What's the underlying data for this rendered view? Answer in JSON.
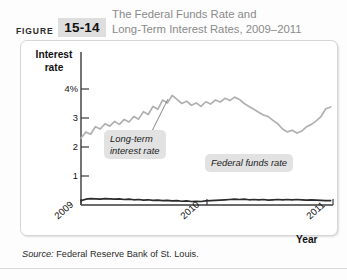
{
  "figure": {
    "label": "FIGURE",
    "number": "15-14"
  },
  "title": {
    "line1": "The Federal Funds Rate and",
    "line2": "Long-Term Interest Rates, 2009–2011"
  },
  "source": {
    "prefix": "Source:",
    "text": "Federal Reserve Bank of St. Louis."
  },
  "colors": {
    "longterm_line": "#b0b0b0",
    "federal_funds_line": "#2b2b2b",
    "axis": "#3a3a3a",
    "callout_bg": "#e2e2e2",
    "title_text": "#8a8a8a",
    "figure_box_bg": "#dedede"
  },
  "chart_data": {
    "type": "line",
    "title": "The Federal Funds Rate and Long-Term Interest Rates, 2009–2011",
    "xlabel": "Year",
    "ylabel": "Interest rate",
    "ylim": [
      0,
      4.4
    ],
    "xlim": [
      2009.0,
      2011.1
    ],
    "grid": false,
    "legend": "annotations",
    "yticks": [
      {
        "value": 4,
        "label": "4%"
      },
      {
        "value": 3,
        "label": "3"
      },
      {
        "value": 2,
        "label": "2"
      },
      {
        "value": 1,
        "label": "1"
      }
    ],
    "xticks": [
      {
        "value": 2009,
        "label": "2009"
      },
      {
        "value": 2010,
        "label": "2010"
      },
      {
        "value": 2011,
        "label": "2011"
      }
    ],
    "annotations": [
      {
        "name": "long-term-interest-rate",
        "line1": "Long-term",
        "line2": "interest rate",
        "text": "Long-term interest rate"
      },
      {
        "name": "federal-funds-rate",
        "text": "Federal funds rate"
      }
    ],
    "series": [
      {
        "name": "Long-term interest rate",
        "color": "#b0b0b0",
        "x": [
          2009.0,
          2009.04,
          2009.08,
          2009.12,
          2009.16,
          2009.2,
          2009.24,
          2009.28,
          2009.32,
          2009.36,
          2009.4,
          2009.44,
          2009.48,
          2009.52,
          2009.56,
          2009.6,
          2009.64,
          2009.68,
          2009.72,
          2009.76,
          2009.8,
          2009.84,
          2009.88,
          2009.92,
          2009.96,
          2010.0,
          2010.04,
          2010.08,
          2010.12,
          2010.16,
          2010.2,
          2010.24,
          2010.28,
          2010.32,
          2010.36,
          2010.4,
          2010.44,
          2010.48,
          2010.52,
          2010.56,
          2010.6,
          2010.64,
          2010.68,
          2010.72,
          2010.76,
          2010.8,
          2010.84,
          2010.88,
          2010.92,
          2010.96,
          2011.0,
          2011.04,
          2011.08
        ],
        "values": [
          2.3,
          2.52,
          2.44,
          2.7,
          2.62,
          2.8,
          2.72,
          2.88,
          2.78,
          2.95,
          2.86,
          3.05,
          2.96,
          3.22,
          3.12,
          3.4,
          3.3,
          3.62,
          3.52,
          3.78,
          3.64,
          3.5,
          3.58,
          3.44,
          3.52,
          3.4,
          3.56,
          3.48,
          3.62,
          3.55,
          3.68,
          3.6,
          3.72,
          3.64,
          3.5,
          3.4,
          3.3,
          3.2,
          3.1,
          3.05,
          2.92,
          2.8,
          2.62,
          2.52,
          2.58,
          2.48,
          2.55,
          2.7,
          2.78,
          2.9,
          3.05,
          3.32,
          3.38
        ]
      },
      {
        "name": "Federal funds rate",
        "color": "#2b2b2b",
        "x": [
          2009.0,
          2009.04,
          2009.08,
          2009.12,
          2009.16,
          2009.2,
          2009.24,
          2009.28,
          2009.32,
          2009.36,
          2009.4,
          2009.44,
          2009.48,
          2009.52,
          2009.56,
          2009.6,
          2009.64,
          2009.68,
          2009.72,
          2009.76,
          2009.8,
          2009.84,
          2009.88,
          2009.92,
          2009.96,
          2010.0,
          2010.04,
          2010.08,
          2010.12,
          2010.16,
          2010.2,
          2010.24,
          2010.28,
          2010.32,
          2010.36,
          2010.4,
          2010.44,
          2010.48,
          2010.52,
          2010.56,
          2010.6,
          2010.64,
          2010.68,
          2010.72,
          2010.76,
          2010.8,
          2010.84,
          2010.88,
          2010.92,
          2010.96,
          2011.0,
          2011.04,
          2011.08
        ],
        "values": [
          0.15,
          0.2,
          0.22,
          0.21,
          0.2,
          0.22,
          0.21,
          0.2,
          0.21,
          0.19,
          0.2,
          0.18,
          0.19,
          0.17,
          0.18,
          0.16,
          0.17,
          0.15,
          0.16,
          0.14,
          0.15,
          0.13,
          0.14,
          0.12,
          0.13,
          0.12,
          0.14,
          0.15,
          0.16,
          0.17,
          0.18,
          0.19,
          0.2,
          0.19,
          0.2,
          0.18,
          0.19,
          0.18,
          0.19,
          0.17,
          0.18,
          0.19,
          0.18,
          0.19,
          0.18,
          0.19,
          0.18,
          0.17,
          0.18,
          0.17,
          0.16,
          0.15,
          0.15
        ]
      }
    ]
  }
}
